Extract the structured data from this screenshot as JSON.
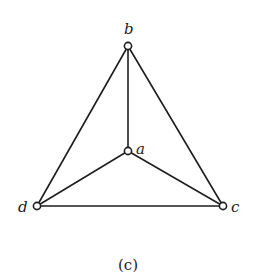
{
  "diagram": {
    "type": "graph",
    "caption": "(c)",
    "nodes": [
      {
        "id": "a",
        "label": "a",
        "x": 128,
        "y": 151
      },
      {
        "id": "b",
        "label": "b",
        "x": 128,
        "y": 46
      },
      {
        "id": "c",
        "label": "c",
        "x": 223,
        "y": 206
      },
      {
        "id": "d",
        "label": "d",
        "x": 37,
        "y": 206
      }
    ],
    "edges": [
      [
        "b",
        "a"
      ],
      [
        "b",
        "d"
      ],
      [
        "b",
        "c"
      ],
      [
        "a",
        "d"
      ],
      [
        "a",
        "c"
      ],
      [
        "d",
        "c"
      ]
    ],
    "colors": {
      "ink": "#1e1e1e",
      "background": "#ffffff"
    }
  }
}
